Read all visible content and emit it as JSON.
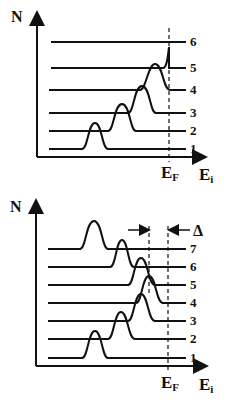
{
  "panels": [
    {
      "id": "top",
      "y_axis_label": "N",
      "x_axis_label": "E",
      "x_axis_sub": "i",
      "fermi_label": "E",
      "fermi_sub": "F",
      "levels": [
        "1",
        "2",
        "3",
        "4",
        "5",
        "6"
      ]
    },
    {
      "id": "bottom",
      "y_axis_label": "N",
      "x_axis_label": "E",
      "x_axis_sub": "i",
      "fermi_label": "E",
      "fermi_sub": "F",
      "delta_label": "Δ",
      "levels": [
        "1",
        "2",
        "3",
        "4",
        "5",
        "6",
        "7"
      ]
    }
  ],
  "colors": {
    "ink": "#111111",
    "background": "#ffffff"
  }
}
